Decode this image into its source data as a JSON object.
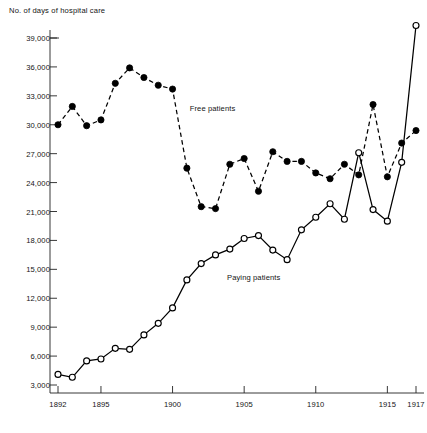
{
  "chart_data": {
    "type": "line",
    "title": "No. of days of hospital care",
    "xlabel": "",
    "ylabel": "No. of days of hospital care",
    "xlim": [
      1892,
      1917
    ],
    "ylim": [
      2000,
      40800
    ],
    "grid": false,
    "legend_position": "inline-annotation",
    "y_ticks": [
      3000,
      6000,
      9000,
      12000,
      15000,
      18000,
      21000,
      24000,
      27000,
      30000,
      33000,
      36000,
      39000
    ],
    "y_tick_labels": [
      "3,000",
      "6,000",
      "9,000",
      "12,000",
      "15,000",
      "18,000",
      "21,000",
      "24,000",
      "27,000",
      "30,000",
      "33,000",
      "36,000",
      "39,000"
    ],
    "x_ticks": [
      1892,
      1895,
      1900,
      1905,
      1910,
      1915,
      1917
    ],
    "x_tick_labels": [
      "1892",
      "1895",
      "1900",
      "1905",
      "1910",
      "1915",
      "1917"
    ],
    "x": [
      1892,
      1893,
      1894,
      1895,
      1896,
      1897,
      1898,
      1899,
      1900,
      1901,
      1902,
      1903,
      1904,
      1905,
      1906,
      1907,
      1908,
      1909,
      1910,
      1911,
      1912,
      1913,
      1914,
      1915,
      1916,
      1917
    ],
    "series": [
      {
        "name": "Free patients",
        "label": "Free patients",
        "marker": "filled-circle",
        "linestyle": "dashed",
        "color": "#000000",
        "label_x": 1901.2,
        "label_y": 31600,
        "values": [
          30000,
          31900,
          29900,
          30500,
          34300,
          35900,
          34900,
          34100,
          33700,
          25500,
          21500,
          21300,
          25900,
          26500,
          23100,
          27200,
          26200,
          26200,
          25000,
          24400,
          25900,
          24800,
          32100,
          24600,
          28100,
          29400
        ]
      },
      {
        "name": "Paying patients",
        "label": "Paying patients",
        "marker": "open-circle",
        "linestyle": "solid",
        "color": "#000000",
        "label_x": 1903.8,
        "label_y": 14100,
        "values": [
          4100,
          3800,
          5500,
          5700,
          6800,
          6700,
          8200,
          9400,
          11000,
          13900,
          15600,
          16500,
          17100,
          18200,
          18500,
          17000,
          16000,
          19100,
          20400,
          21800,
          20200,
          27100,
          21200,
          20000,
          26100,
          40300
        ]
      }
    ]
  },
  "axes": {
    "title_text": "No. of days of hospital care"
  }
}
